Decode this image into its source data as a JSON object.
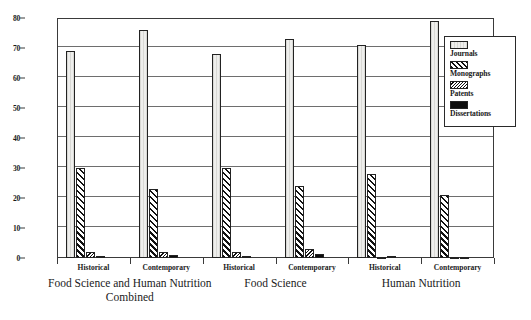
{
  "chart_data": {
    "type": "bar",
    "title": "",
    "xlabel": "",
    "ylabel": "",
    "ylim": [
      0,
      80
    ],
    "yticks": [
      0,
      10,
      20,
      30,
      40,
      50,
      60,
      70,
      80
    ],
    "grid": true,
    "legend_position": "top-right",
    "legend_entries": [
      "Journals",
      "Monographs",
      "Patents",
      "Dissertations"
    ],
    "group_labels": [
      "Food Science and Human Nutrition\nCombined",
      "Food Science",
      "Human Nutrition"
    ],
    "subgroup_labels": [
      "Historical",
      "Contemporary"
    ],
    "categories": [
      "Food Science and Human Nutrition Combined - Historical",
      "Food Science and Human Nutrition Combined - Contemporary",
      "Food Science - Historical",
      "Food Science - Contemporary",
      "Human Nutrition - Historical",
      "Human Nutrition - Contemporary"
    ],
    "series": [
      {
        "name": "Journals",
        "values": [
          69,
          76,
          68,
          73,
          71,
          79
        ]
      },
      {
        "name": "Monographs",
        "values": [
          30,
          23,
          30,
          24,
          28,
          21
        ]
      },
      {
        "name": "Patents",
        "values": [
          2,
          2,
          2,
          3,
          0.3,
          0.3
        ]
      },
      {
        "name": "Dissertations",
        "values": [
          0.6,
          1,
          0.6,
          1.3,
          0.8,
          0.5
        ]
      }
    ]
  },
  "legend": {
    "items": [
      {
        "label": "Journals",
        "swatch": "journals-swatch"
      },
      {
        "label": "Monographs",
        "swatch": "monographs-swatch"
      },
      {
        "label": "Patents",
        "swatch": "patents-swatch"
      },
      {
        "label": "Dissertations",
        "swatch": "dissertations-swatch"
      }
    ]
  },
  "axis": {
    "y_tick_labels": [
      "0",
      "10",
      "20",
      "30",
      "40",
      "50",
      "60",
      "70",
      "80"
    ]
  }
}
